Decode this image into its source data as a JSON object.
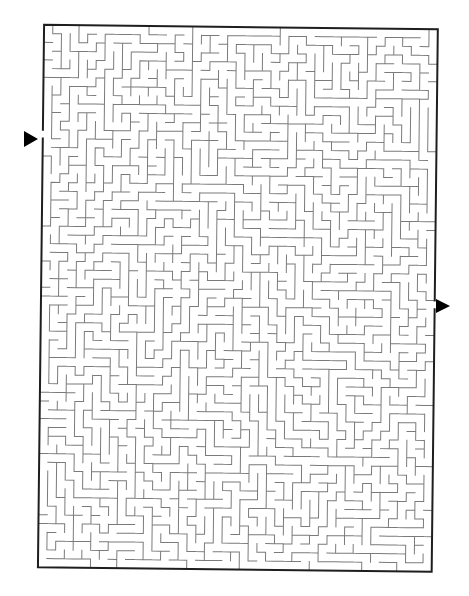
{
  "maze": {
    "title": "Maze puzzle",
    "cols": 45,
    "rows": 62,
    "origin": {
      "x": 41,
      "y": 27
    },
    "cell_size": 8.75,
    "rotation_deg": 0.65,
    "seed": 7321,
    "colors": {
      "background": "#ffffff",
      "inner_wall": "#7a7a7a",
      "outer_wall": "#1e1e1e",
      "arrow": "#000000"
    },
    "entrance": {
      "side": "left",
      "row": 12,
      "label": "Start"
    },
    "exit": {
      "side": "right",
      "row": 31,
      "label": "Finish"
    }
  },
  "arrows": {
    "entry": {
      "points": "24,131 38,139 24,147",
      "direction": "right",
      "icon": "triangle-right-icon"
    },
    "exit": {
      "points": "436,299 450,306 436,313",
      "direction": "right",
      "icon": "triangle-right-icon"
    }
  }
}
